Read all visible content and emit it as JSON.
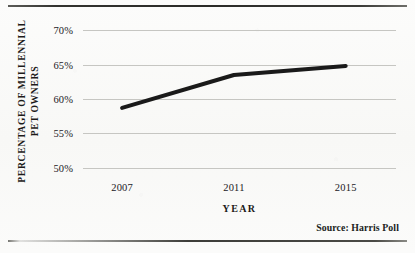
{
  "figure": {
    "source_note": "Source: Harris Poll"
  },
  "chart_data": {
    "type": "line",
    "title": "",
    "subtitle": "",
    "xlabel": "YEAR",
    "ylabel": "PERCENTAGE OF MILLENNIAL PET OWNERS",
    "ylabel_lines": [
      "PERCENTAGE OF MILLENNIAL",
      "PET OWNERS"
    ],
    "x": [
      2007,
      2011,
      2015
    ],
    "categories": [
      "2007",
      "2011",
      "2015"
    ],
    "values": [
      58.7,
      63.5,
      64.8
    ],
    "series": [
      {
        "name": "Percentage of millennial pet owners",
        "values": [
          58.7,
          63.5,
          64.8
        ],
        "color": "#1a1a1a",
        "line_width": 4
      }
    ],
    "xtick_labels": [
      "2007",
      "2011",
      "2015"
    ],
    "ytick_labels": [
      "70%",
      "65%",
      "60%",
      "55%",
      "50%"
    ],
    "ytick_values": [
      70,
      65,
      60,
      55,
      50
    ],
    "ylim": [
      48.5,
      71.5
    ],
    "xlim": [
      2005.6,
      2016.8
    ],
    "grid": "horizontal",
    "grid_color": "#c6c6c2",
    "legend": "none",
    "annotations": [
      "Source: Harris Poll"
    ],
    "background_color": "#fbfbfa",
    "text_color": "#1d1b19"
  }
}
